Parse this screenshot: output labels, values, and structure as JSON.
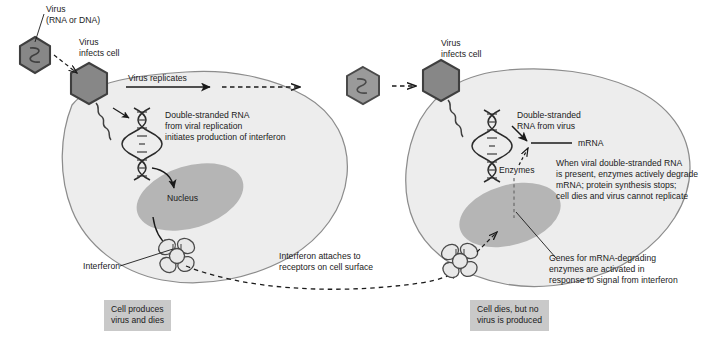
{
  "figure": {
    "type": "biological-process-diagram",
    "width": 717,
    "height": 338
  },
  "colors": {
    "cytoplasm_fill": "#ededed",
    "cytoplasm_stroke": "#8c8c8c",
    "nucleus_fill": "#b5b5b5",
    "virus_fill": "#878787",
    "virus_stroke": "#3f3f3f",
    "interferon_fill": "#e8e8e8",
    "interferon_stroke": "#555555",
    "callout_box_fill": "#c9c9c9",
    "text": "#1a1a1a",
    "line": "#1a1a1a",
    "background": "#ffffff"
  },
  "left_panel": {
    "name": "virus-infected-cell-producing-interferon",
    "virus_label": "Virus\n(RNA or DNA)",
    "virus_label_line1": "Virus",
    "virus_label_line2": "(RNA or DNA)",
    "infects_label_line1": "Virus",
    "infects_label_line2": "infects cell",
    "replicates_label": "Virus replicates",
    "dsrna_line1": "Double-stranded RNA",
    "dsrna_line2": "from viral replication",
    "dsrna_line3": "initiates production of interferon",
    "nucleus_label": "Nucleus",
    "interferon_label": "Interferon",
    "outcome_box_line1": "Cell produces",
    "outcome_box_line2": "virus and dies"
  },
  "middle": {
    "transfer_label": "Interferon attaches to\nreceptors on cell surface",
    "transfer_line1": "Interferon attaches to",
    "transfer_line2": "receptors on cell surface"
  },
  "right_panel": {
    "name": "interferon-protected-cell",
    "infects_label_line1": "Virus",
    "infects_label_line2": "infects cell",
    "dsrna_line1": "Double-stranded",
    "dsrna_line2": "RNA from virus",
    "mrna_label": "mRNA",
    "enzymes_label": "Enzymes",
    "explain_line1": "When viral double-stranded RNA",
    "explain_line2": "is present, enzymes actively degrade",
    "explain_line3": "mRNA; protein synthesis stops;",
    "explain_line4": "cell dies and virus cannot replicate",
    "genes_line1": "Genes for mRNA-degrading",
    "genes_line2": "enzymes are activated in",
    "genes_line3": "response to signal from interferon",
    "outcome_box_line1": "Cell dies, but no",
    "outcome_box_line2": "virus is produced"
  },
  "icons": {
    "virus": "hexagon-virus-icon",
    "dsrna": "double-helix-icon",
    "nucleus": "nucleus-ellipse-icon",
    "interferon": "interferon-clover-icon",
    "receptor": "receptor-squiggle-icon",
    "arrow_solid": "solid-arrow-icon",
    "arrow_dashed": "dashed-arrow-icon",
    "mrna": "mrna-strand-icon"
  }
}
